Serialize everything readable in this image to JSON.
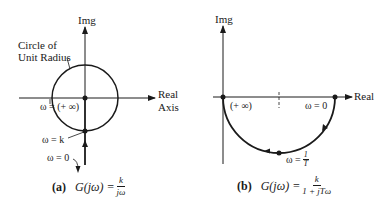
{
  "figure_a": {
    "axis_imag_label": "Img",
    "axis_real_label_line1": "Real",
    "axis_real_label_line2": "Axis",
    "circle_label_line1": "Circle of",
    "circle_label_line2": "Unit Radius",
    "omega_inf_label": "ω = (+ ∞)",
    "omega_k_label": "ω = k",
    "omega_zero_label": "ω = 0",
    "caption_tag": "(a)",
    "caption_lhs": "G(jω) =",
    "caption_num": "k",
    "caption_den": "jω"
  },
  "figure_b": {
    "axis_imag_label": "Img",
    "axis_real_label": "Real",
    "omega_inf_label": "(+ ∞)",
    "omega_zero_label": "ω = 0",
    "omega_mid_prefix": "ω =",
    "omega_mid_num": "1",
    "omega_mid_den": "T",
    "caption_tag": "(b)",
    "caption_lhs": "G(jω) =",
    "caption_num": "k",
    "caption_den": "1 + jTω"
  },
  "colors": {
    "line": "#1a1a1a",
    "background": "#ffffff"
  }
}
